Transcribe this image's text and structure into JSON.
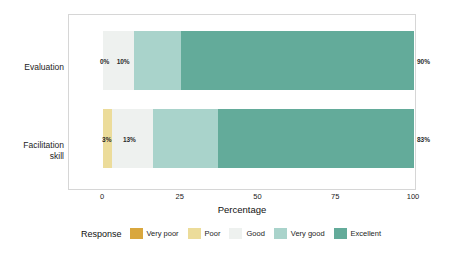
{
  "chart_data": {
    "type": "bar",
    "orientation": "horizontal",
    "stacked": true,
    "stack_mode": "percent",
    "title": "",
    "xlabel": "Percentage",
    "ylabel": "",
    "xlim": [
      0,
      100
    ],
    "xticks": [
      0,
      25,
      50,
      75,
      100
    ],
    "xtick_labels": [
      "0",
      "25",
      "50",
      "75",
      "100"
    ],
    "grid": false,
    "legend_title": "Response",
    "legend_position": "bottom",
    "categories": [
      "Evaluation",
      "Facilitation skill"
    ],
    "series": [
      {
        "name": "Very poor",
        "color": "#d9a73e",
        "values": [
          0,
          0
        ]
      },
      {
        "name": "Poor",
        "color": "#ecdc9a",
        "values": [
          0,
          3
        ]
      },
      {
        "name": "Good",
        "color": "#eef1ef",
        "values": [
          10,
          13
        ]
      },
      {
        "name": "Very good",
        "color": "#a9d3cb",
        "values": [
          15,
          21
        ]
      },
      {
        "name": "Excellent",
        "color": "#63ab9a",
        "values": [
          75,
          63
        ]
      }
    ],
    "annotations": [
      {
        "category": "Evaluation",
        "text": "0%",
        "x": 0.5,
        "placement": "inside-left"
      },
      {
        "category": "Evaluation",
        "text": "10%",
        "x": 6.5,
        "placement": "inside"
      },
      {
        "category": "Evaluation",
        "text": "90%",
        "x": 101,
        "placement": "outside-right"
      },
      {
        "category": "Facilitation skill",
        "text": "3%",
        "x": 1.2,
        "placement": "inside-left"
      },
      {
        "category": "Facilitation skill",
        "text": "13%",
        "x": 8.5,
        "placement": "inside"
      },
      {
        "category": "Facilitation skill",
        "text": "83%",
        "x": 101,
        "placement": "outside-right"
      }
    ]
  },
  "axis": {
    "y_labels": [
      "Evaluation",
      "Facilitation\nskill"
    ],
    "x_title": "Percentage",
    "x_ticks": [
      "0",
      "25",
      "50",
      "75",
      "100"
    ]
  },
  "legend": {
    "title": "Response",
    "items": [
      {
        "label": "Very poor",
        "color": "#d9a73e"
      },
      {
        "label": "Poor",
        "color": "#ecdc9a"
      },
      {
        "label": "Good",
        "color": "#eef1ef"
      },
      {
        "label": "Very good",
        "color": "#a9d3cb"
      },
      {
        "label": "Excellent",
        "color": "#63ab9a"
      }
    ]
  },
  "style": {
    "panel_background": "#ffffff",
    "panel_border": "#d6d6d6",
    "page_background": "#ffffff",
    "text_color": "#1c1c1c"
  }
}
